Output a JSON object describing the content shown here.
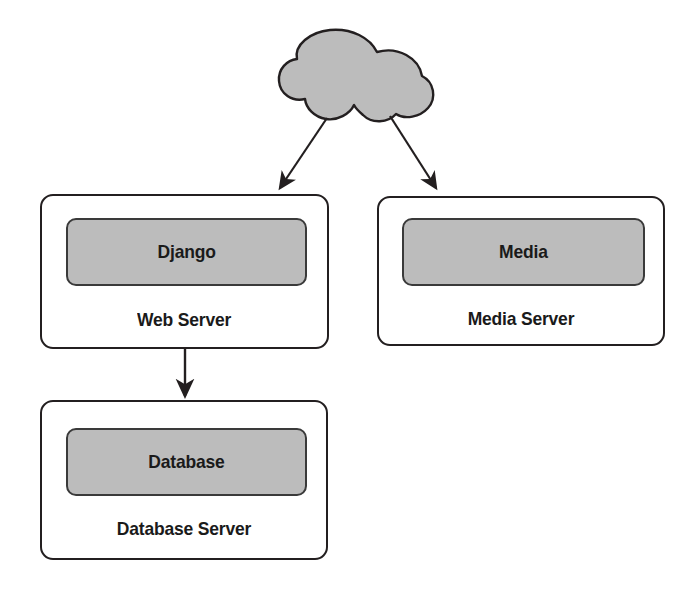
{
  "diagram": {
    "colors": {
      "fill_gray": "#bcbcbc",
      "stroke_dark": "#231f20",
      "inner_stroke": "#3a3a3a",
      "background": "#ffffff",
      "text": "#1a1a1a"
    },
    "cloud": {
      "name": "internet-cloud",
      "label": ""
    },
    "nodes": [
      {
        "id": "web-server",
        "inner_label": "Django",
        "label": "Web Server"
      },
      {
        "id": "media-server",
        "inner_label": "Media",
        "label": "Media Server"
      },
      {
        "id": "database-server",
        "inner_label": "Database",
        "label": "Database Server"
      }
    ],
    "connections": [
      {
        "id": "cloud-to-web",
        "from": "internet-cloud",
        "to": "web-server",
        "arrow": true
      },
      {
        "id": "cloud-to-media",
        "from": "internet-cloud",
        "to": "media-server",
        "arrow": true
      },
      {
        "id": "web-to-database",
        "from": "web-server",
        "to": "database-server",
        "arrow": true
      }
    ]
  }
}
